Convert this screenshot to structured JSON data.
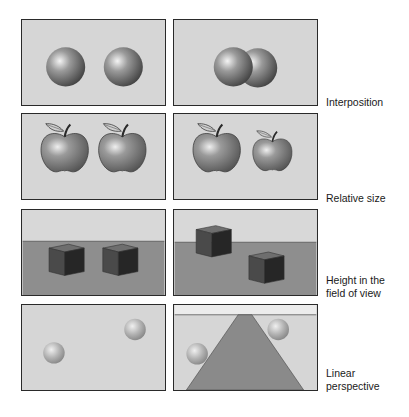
{
  "figure": {
    "rows": [
      {
        "id": "interposition",
        "label": "Interposition"
      },
      {
        "id": "relative-size",
        "label": "Relative size"
      },
      {
        "id": "height-in-field",
        "label": "Height in the field of view",
        "label_lines": [
          "Height in the",
          "field of view"
        ]
      },
      {
        "id": "linear-perspective",
        "label": "Linear perspective",
        "label_lines": [
          "Linear",
          "perspective"
        ]
      }
    ],
    "colors": {
      "panel_bg": "#d6d6d6",
      "panel_border": "#2a2a2a",
      "floor": "#8e8e8e",
      "sky": "#d8d8d8",
      "road": "#8a8a8a",
      "sphere_dark": "#3e3e3e",
      "sphere_light": "#f2f2f2"
    }
  }
}
